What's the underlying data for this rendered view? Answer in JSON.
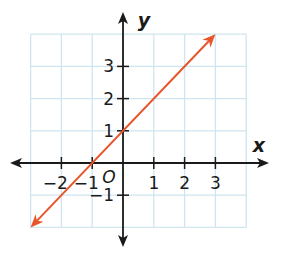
{
  "chart_data": {
    "type": "line",
    "title": "",
    "xlabel": "x",
    "ylabel": "y",
    "origin_label": "O",
    "xlim": [
      -3,
      4
    ],
    "ylim": [
      -2,
      4
    ],
    "grid": true,
    "x_ticks": [
      -2,
      -1,
      1,
      2,
      3
    ],
    "y_ticks": [
      -1,
      1,
      2,
      3
    ],
    "x_tick_labels": [
      "−2",
      "−1",
      "1",
      "2",
      "3"
    ],
    "y_tick_labels": [
      "−1",
      "1",
      "2",
      "3"
    ],
    "series": [
      {
        "name": "y = x + 1",
        "points": [
          [
            -3,
            -2
          ],
          [
            3,
            4
          ]
        ],
        "arrows": "both"
      }
    ],
    "colors": {
      "line": "#e8552a",
      "grid": "#cfe5ef",
      "axis": "#1a1a1a"
    }
  }
}
